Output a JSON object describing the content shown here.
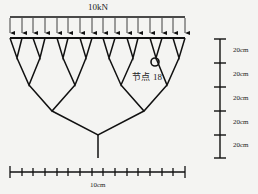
{
  "load": {
    "label": "10kN",
    "arrow_count": 16
  },
  "node": {
    "label_prefix": "节点",
    "label_number": "18"
  },
  "horizontal_scale": {
    "label": "10cm",
    "tick_count": 16
  },
  "vertical_scale": {
    "segments": [
      {
        "label": "20cm"
      },
      {
        "label": "20cm"
      },
      {
        "label": "20cm"
      },
      {
        "label": "20cm"
      },
      {
        "label": "20cm"
      }
    ]
  },
  "colors": {
    "line": "#111111",
    "background": "#f4f4f2"
  }
}
